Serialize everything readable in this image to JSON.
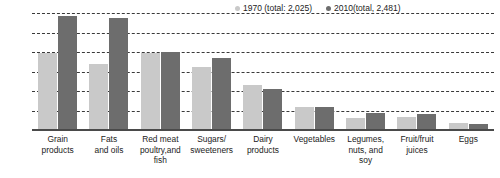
{
  "chart_data": {
    "type": "bar",
    "title": "",
    "subtitle": "",
    "xlabel": "",
    "ylabel": "",
    "ylim": [
      0,
      600
    ],
    "yticks": [
      100,
      200,
      300,
      400,
      500,
      600
    ],
    "grid": true,
    "legend_position": "top-right",
    "categories": [
      "Grain products",
      "Fats and oils",
      "Red meat poultry,and fish",
      "Sugars/ sweeteners",
      "Dairy products",
      "Vegetables",
      "Legumes, nuts, and soy",
      "Fruit/fruit juices",
      "Eggs"
    ],
    "category_lines": [
      [
        "Grain",
        "products"
      ],
      [
        "Fats",
        "and oils"
      ],
      [
        "Red meat",
        "poultry,and fish"
      ],
      [
        "Sugars/",
        "sweeteners"
      ],
      [
        "Dairy",
        "products"
      ],
      [
        "Vegetables",
        ""
      ],
      [
        "Legumes,",
        "nuts, and soy"
      ],
      [
        "Fruit/fruit",
        "juices"
      ],
      [
        "Eggs",
        ""
      ]
    ],
    "series": [
      {
        "name": "1970 (total: 2,025)",
        "color": "#c9c9c9",
        "values": [
          400,
          345,
          400,
          330,
          235,
          125,
          65,
          70,
          40
        ]
      },
      {
        "name": "2010(total, 2,481)",
        "color": "#6d6d6d",
        "values": [
          590,
          580,
          405,
          375,
          215,
          125,
          90,
          85,
          38
        ]
      }
    ]
  },
  "legend": {
    "items": [
      {
        "label": "1970 (total: 2,025)",
        "color": "#c9c9c9"
      },
      {
        "label": "2010(total, 2,481)",
        "color": "#6d6d6d"
      }
    ]
  }
}
